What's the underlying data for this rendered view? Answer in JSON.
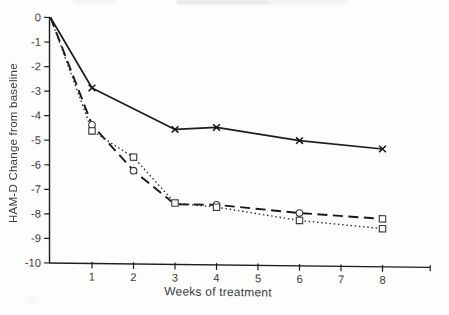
{
  "figure": {
    "background": "#fdfdfc",
    "ink_color": "#1d1d1d",
    "text_color": "#3c3c3c"
  },
  "chart_data": {
    "type": "line",
    "title": "",
    "xlabel": "Weeks of treatment",
    "ylabel": "HAM-D Change from baseline",
    "xlim": [
      0,
      9.15
    ],
    "ylim": [
      -10,
      0
    ],
    "x_ticks": [
      1,
      2,
      3,
      4,
      5,
      6,
      7,
      8
    ],
    "y_ticks": [
      0,
      -1,
      -2,
      -3,
      -4,
      -5,
      -6,
      -7,
      -8,
      -9,
      -10
    ],
    "grid": false,
    "legend": "none",
    "x_axis_end_tick_unlabeled": true,
    "series": [
      {
        "name": "solid-x-markers",
        "line_style": "solid",
        "marker": "x",
        "x": [
          0,
          1,
          3,
          4,
          6,
          8
        ],
        "y": [
          0,
          -2.85,
          -4.5,
          -4.4,
          -4.9,
          -5.2
        ],
        "point_markers": [
          "none",
          "x",
          "x",
          "x",
          "x",
          "x"
        ]
      },
      {
        "name": "dashed-circle-markers",
        "line_style": "dashed",
        "marker": "circle",
        "x": [
          0,
          1,
          2,
          3,
          4,
          6,
          8
        ],
        "y": [
          0,
          -4.35,
          -6.2,
          -7.55,
          -7.55,
          -7.85,
          -8.05
        ],
        "point_markers": [
          "none",
          "circle",
          "circle",
          "none",
          "circle",
          "circle",
          "square"
        ]
      },
      {
        "name": "dotted-square-markers",
        "line_style": "dotted",
        "marker": "square",
        "x": [
          0,
          1,
          2,
          3,
          4,
          6,
          8
        ],
        "y": [
          0,
          -4.6,
          -5.65,
          -7.5,
          -7.65,
          -8.15,
          -8.45
        ],
        "point_markers": [
          "none",
          "square",
          "square",
          "square",
          "square",
          "square",
          "square"
        ]
      }
    ]
  }
}
